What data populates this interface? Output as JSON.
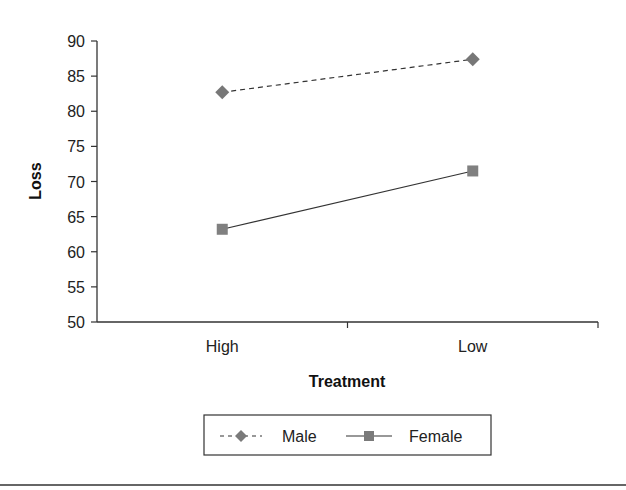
{
  "chart_data": {
    "type": "line",
    "title": "",
    "xlabel": "Treatment",
    "ylabel": "Loss",
    "categories": [
      "High",
      "Low"
    ],
    "series": [
      {
        "name": "Male",
        "values": [
          82.7,
          87.4
        ],
        "line_style": "dashed",
        "marker": "diamond",
        "color": "#777777"
      },
      {
        "name": "Female",
        "values": [
          63.2,
          71.5
        ],
        "line_style": "solid",
        "marker": "square",
        "color": "#808080"
      }
    ],
    "ylim": [
      50,
      90
    ],
    "yticks": [
      50,
      55,
      60,
      65,
      70,
      75,
      80,
      85,
      90
    ],
    "grid": false,
    "legend_position": "bottom"
  },
  "colors": {
    "axis": "#333333",
    "line": "#333333",
    "marker": "#7a7a7a"
  }
}
